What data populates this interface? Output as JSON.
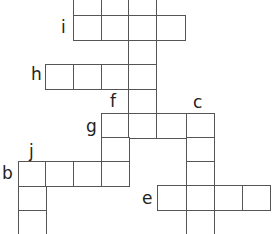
{
  "puzzle": {
    "type": "crossword",
    "line_color": "#555555",
    "labels": [
      {
        "text": "i",
        "x": 61,
        "y": 19
      },
      {
        "text": "h",
        "x": 31,
        "y": 66
      },
      {
        "text": "f",
        "x": 110,
        "y": 93
      },
      {
        "text": "c",
        "x": 193,
        "y": 94
      },
      {
        "text": "g",
        "x": 86,
        "y": 118
      },
      {
        "text": "j",
        "x": 29,
        "y": 143
      },
      {
        "text": "b",
        "x": 2,
        "y": 165
      },
      {
        "text": "e",
        "x": 142,
        "y": 190
      }
    ],
    "cells": [
      {
        "x": 73,
        "y": -10,
        "w": 28,
        "h": 25
      },
      {
        "x": 101,
        "y": -10,
        "w": 28,
        "h": 25
      },
      {
        "x": 128,
        "y": -10,
        "w": 28,
        "h": 25
      },
      {
        "x": 73,
        "y": 15,
        "w": 28,
        "h": 25
      },
      {
        "x": 101,
        "y": 15,
        "w": 28,
        "h": 25
      },
      {
        "x": 128,
        "y": 15,
        "w": 28,
        "h": 25
      },
      {
        "x": 156,
        "y": 15,
        "w": 29,
        "h": 25
      },
      {
        "x": 128,
        "y": 40,
        "w": 28,
        "h": 25
      },
      {
        "x": 45,
        "y": 64,
        "w": 28,
        "h": 25
      },
      {
        "x": 73,
        "y": 64,
        "w": 28,
        "h": 25
      },
      {
        "x": 101,
        "y": 64,
        "w": 28,
        "h": 25
      },
      {
        "x": 128,
        "y": 64,
        "w": 28,
        "h": 25
      },
      {
        "x": 128,
        "y": 89,
        "w": 28,
        "h": 25
      },
      {
        "x": 101,
        "y": 113,
        "w": 28,
        "h": 25
      },
      {
        "x": 128,
        "y": 113,
        "w": 28,
        "h": 25
      },
      {
        "x": 156,
        "y": 113,
        "w": 30,
        "h": 25
      },
      {
        "x": 186,
        "y": 113,
        "w": 28,
        "h": 25
      },
      {
        "x": 101,
        "y": 137,
        "w": 28,
        "h": 25
      },
      {
        "x": 186,
        "y": 137,
        "w": 28,
        "h": 25
      },
      {
        "x": 18,
        "y": 161,
        "w": 28,
        "h": 25
      },
      {
        "x": 45,
        "y": 161,
        "w": 28,
        "h": 25
      },
      {
        "x": 73,
        "y": 161,
        "w": 28,
        "h": 25
      },
      {
        "x": 101,
        "y": 161,
        "w": 28,
        "h": 25
      },
      {
        "x": 186,
        "y": 161,
        "w": 28,
        "h": 25
      },
      {
        "x": 18,
        "y": 186,
        "w": 28,
        "h": 25
      },
      {
        "x": 157,
        "y": 185,
        "w": 30,
        "h": 25
      },
      {
        "x": 186,
        "y": 185,
        "w": 28,
        "h": 25
      },
      {
        "x": 214,
        "y": 185,
        "w": 28,
        "h": 25
      },
      {
        "x": 242,
        "y": 185,
        "w": 28,
        "h": 25
      },
      {
        "x": 18,
        "y": 210,
        "w": 28,
        "h": 25
      },
      {
        "x": 186,
        "y": 210,
        "w": 28,
        "h": 25
      }
    ]
  }
}
